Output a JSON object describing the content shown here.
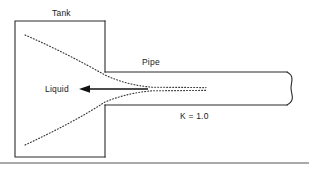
{
  "diagram": {
    "type": "engineering-schematic",
    "labels": {
      "tank": "Tank",
      "pipe": "Pipe",
      "liquid": "Liquid",
      "k_coefficient": "K = 1.0"
    },
    "colors": {
      "line": "#2b2b2b",
      "streamline": "#3a3a3a",
      "background": "#ffffff",
      "baseline": "#555555"
    },
    "geometry": {
      "tank": {
        "x": 15,
        "y": 21,
        "width": 90,
        "height": 136
      },
      "pipe": {
        "x": 105,
        "y": 72,
        "width": 184,
        "height": 33
      },
      "pipe_break_x": 289,
      "baseline_y": 163,
      "flow_arrow": {
        "from_x": 148,
        "to_x": 80,
        "y": 89
      }
    },
    "annotations": {
      "entrance_type": "sharp-edged re-entrant entrance",
      "flow_direction": "tank to pipe"
    }
  }
}
